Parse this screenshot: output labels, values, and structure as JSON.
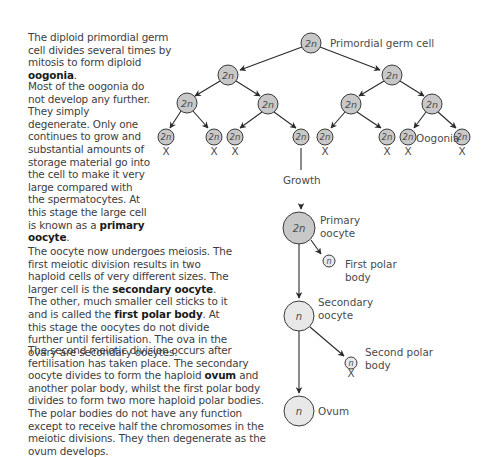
{
  "text": {
    "p1": {
      "before": "The diploid primordial germ cell divides several times by mitosis to form diploid ",
      "bold": "oogonia",
      "after": "."
    },
    "p2": {
      "before": "Most of the oogonia do not develop any further. They simply degenerate. Only one continues to grow and substantial amounts of storage material go into the cell to make it very large compared with the spermatocytes. At this stage the large cell is known as a ",
      "bold": "primary oocyte",
      "after": "."
    },
    "p3": {
      "part1": "The oocyte now undergoes meiosis. The first meiotic division results in two haploid cells of very different sizes. The larger cell is the ",
      "bold1": "secondary oocyte",
      "part2": ". The other, much smaller cell sticks to it and is called the ",
      "bold2": "first polar body",
      "part3": ". At this stage the oocytes do not divide further until fertilisation. The ova in the ovary are secondary oocytes."
    },
    "p4": {
      "part1": "The second meiotic division occurs after fertilisation has taken place. The secondary oocyte divides to form the haploid ",
      "bold": "ovum",
      "part2": " and another polar body, whilst the first polar body divides to form two more haploid polar bodies. The polar bodies do not have any function except to receive half the chromosomes in the meiotic divisions. They then degenerate as the ovum develops."
    }
  },
  "diagram": {
    "labels": {
      "primordial": "Primordial germ cell",
      "oogonia": "Oogonia",
      "growth": "Growth",
      "primary_1": "Primary",
      "primary_2": "oocyte",
      "first_polar_1": "First polar",
      "first_polar_2": "body",
      "secondary_1": "Secondary",
      "secondary_2": "oocyte",
      "second_polar_1": "Second polar",
      "second_polar_2": "body",
      "ovum": "Ovum"
    },
    "ploidy": {
      "diploid": "2n",
      "haploid": "n"
    },
    "degenerate_mark": "X",
    "colors": {
      "diploid_fill": "#c8c8c8",
      "haploid_fill": "#e8e8e8",
      "stroke": "#3a3a3a"
    }
  }
}
